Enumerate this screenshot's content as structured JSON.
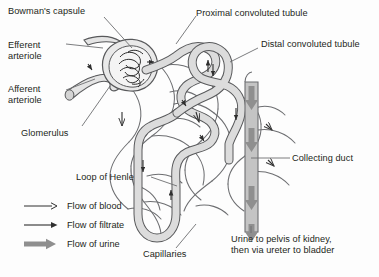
{
  "diagram": {
    "labels": [
      {
        "id": "bowmans-capsule",
        "text": "Bowman's capsule",
        "x": 8,
        "y": 6
      },
      {
        "id": "efferent-arteriole",
        "text": "Efferent\narteriole",
        "x": 8,
        "y": 40
      },
      {
        "id": "afferent-arteriole",
        "text": "Afferent\narteriole",
        "x": 8,
        "y": 84
      },
      {
        "id": "glomerulus",
        "text": "Glomerulus",
        "x": 21,
        "y": 128
      },
      {
        "id": "proximal-convoluted-tubule",
        "text": "Proximal convoluted tubule",
        "x": 196,
        "y": 8
      },
      {
        "id": "distal-convoluted-tubule",
        "text": "Distal convoluted tubule",
        "x": 261,
        "y": 39
      },
      {
        "id": "collecting-duct",
        "text": "Collecting duct",
        "x": 292,
        "y": 153
      },
      {
        "id": "loop-of-henle",
        "text": "Loop of Henle",
        "x": 76,
        "y": 172
      },
      {
        "id": "capillaries",
        "text": "Capillaries",
        "x": 143,
        "y": 249
      },
      {
        "id": "urine-destination",
        "text": "Urine to pelvis of kidney,\nthen via ureter to bladder",
        "x": 231,
        "y": 234
      }
    ],
    "legend": {
      "items": [
        {
          "id": "flow-of-blood",
          "label": "Flow of blood",
          "arrow": "thin-open-arrow"
        },
        {
          "id": "flow-of-filtrate",
          "label": "Flow of filtrate",
          "arrow": "thin-solid-arrow"
        },
        {
          "id": "flow-of-urine",
          "label": "Flow of urine",
          "arrow": "thick-block-arrow"
        }
      ],
      "x": 22,
      "y": 201
    },
    "colors": {
      "background": "#fdfdfd",
      "text": "#231f20",
      "outline": "#58595b",
      "tubule_fill": "#dcdcdc",
      "duct_fill": "#bcbcbc",
      "capillary_stroke": "#6d6e71",
      "urine_arrow": "#8a8a8a"
    }
  }
}
